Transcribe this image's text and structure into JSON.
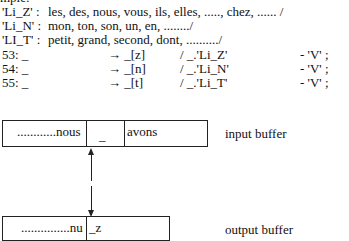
{
  "header_cut": "mple:",
  "lists": [
    {
      "label": "'Li_Z' :",
      "items": "les, des, nous, vous, ils, elles, ....., chez, ...... /"
    },
    {
      "label": "'Li_N' :",
      "items": "mon, ton, son, un, en, ......../"
    },
    {
      "label": "'LI_T' :",
      "items": "petit, grand, second, dont, ........../"
    }
  ],
  "rules": [
    {
      "num": "53: _",
      "arrow": "→ _[z]",
      "context": "/ _.'Li_Z'",
      "cond": "- 'V' ;"
    },
    {
      "num": "54: _",
      "arrow": "→ _[n]",
      "context": "/ _.'Li_N'",
      "cond": "- 'V' ;"
    },
    {
      "num": "55: _",
      "arrow": "→ _[t]",
      "context": "/ _.'Li_T'",
      "cond": "- 'V' ;"
    }
  ],
  "input_buffer": {
    "cells": [
      "............nous",
      "_",
      "avons"
    ],
    "label": "input buffer"
  },
  "output_buffer": {
    "cells": [
      "...............nu",
      "_z"
    ],
    "label": "output buffer"
  },
  "icons": {
    "arrow_up": "arrow-up-icon",
    "arrow_down": "arrow-down-icon"
  }
}
